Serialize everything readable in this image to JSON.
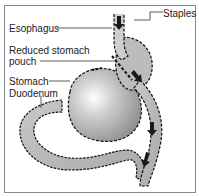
{
  "diagram": {
    "type": "anatomical-illustration",
    "labels": {
      "esophagus": "Esophagus",
      "staples": "Staples",
      "reduced_pouch_line1": "Reduced stomach",
      "reduced_pouch_line2": "pouch",
      "stomach": "Stomach",
      "duodenum": "Duodenum"
    },
    "colors": {
      "organ_fill": "#b4b4b4",
      "organ_light": "#e8e8e8",
      "outline": "#111111",
      "arrow": "#1a1a1a",
      "border": "#8a8a8a"
    }
  }
}
